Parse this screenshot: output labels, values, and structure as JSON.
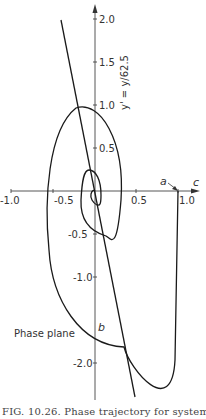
{
  "figure": {
    "panel_label": "Phase plane",
    "caption": "FIG. 10.26. Phase trajectory for system",
    "x_axis": {
      "label": "c",
      "ticks": [
        "-1.0",
        "-0.5",
        "0.5",
        "1.0"
      ],
      "range": [
        -1.0,
        1.0
      ]
    },
    "y_axis": {
      "label": "y' = y/62.5",
      "ticks": [
        "2.0",
        "1.5",
        "1.0",
        "0.5",
        "-0.5",
        "-1.0",
        "-2.0"
      ],
      "range": [
        -2.5,
        2.1
      ]
    },
    "points": {
      "start": "a",
      "crossing": "b"
    },
    "curves": [
      {
        "name": "spiral-trajectory",
        "description": "Phase trajectory spiraling inward from point a (c≈1.0, y'≈0) toward origin"
      },
      {
        "name": "switching-line",
        "description": "Straight line through origin with steep negative slope"
      }
    ]
  }
}
